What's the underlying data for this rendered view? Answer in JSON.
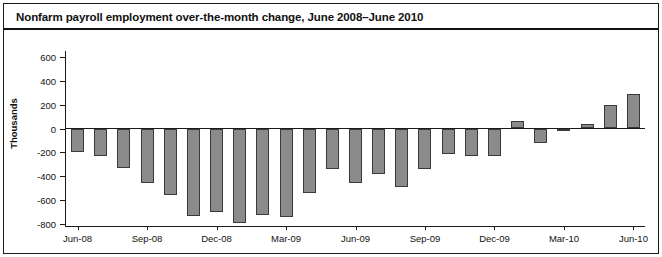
{
  "figure": {
    "title": "Nonfarm payroll employment over-the-month change, June 2008–June 2010"
  },
  "axes": {
    "ylabel": "Thousands",
    "yticks": [
      "600",
      "400",
      "200",
      "0",
      "-200",
      "-400",
      "-600",
      "-800"
    ],
    "xticks": [
      "Jun-08",
      "Sep-08",
      "Dec-08",
      "Mar-09",
      "Jun-09",
      "Sep-09",
      "Dec-09",
      "Mar-10",
      "Jun-10"
    ]
  },
  "colors": {
    "bar_fill": "#8b8b8b",
    "bar_edge": "#3a3a3a",
    "axis": "#1a1a1a",
    "text": "#111111"
  },
  "chart_data": {
    "type": "bar",
    "title": "Nonfarm payroll employment over-the-month change, June 2008–June 2010",
    "xlabel": "",
    "ylabel": "Thousands",
    "ylim": [
      -800,
      600
    ],
    "ytick_values": [
      600,
      400,
      200,
      0,
      -200,
      -400,
      -600,
      -800
    ],
    "grid": false,
    "legend": null,
    "categories": [
      "Jun-08",
      "Jul-08",
      "Aug-08",
      "Sep-08",
      "Oct-08",
      "Nov-08",
      "Dec-08",
      "Jan-09",
      "Feb-09",
      "Mar-09",
      "Apr-09",
      "May-09",
      "Jun-09",
      "Jul-09",
      "Aug-09",
      "Sep-09",
      "Oct-09",
      "Nov-09",
      "Dec-09",
      "Jan-10",
      "Feb-10",
      "Mar-10",
      "Apr-10",
      "May-10",
      "Jun-10"
    ],
    "labeled_categories": [
      "Jun-08",
      "Sep-08",
      "Dec-08",
      "Mar-09",
      "Jun-09",
      "Sep-09",
      "Dec-09",
      "Mar-10",
      "Jun-10"
    ],
    "values": [
      -200,
      -230,
      -330,
      -460,
      -560,
      -730,
      -700,
      -790,
      -720,
      -740,
      -540,
      -340,
      -460,
      -380,
      -490,
      -340,
      -210,
      -230,
      -230,
      60,
      -120,
      -10,
      40,
      200,
      290
    ],
    "values_note": "Monthly over-the-month change in thousands of jobs"
  },
  "series_plot": {
    "bars": [
      {
        "label": "Jun-08",
        "value": -200
      },
      {
        "label": "Jul-08",
        "value": -230
      },
      {
        "label": "Aug-08",
        "value": -330
      },
      {
        "label": "Sep-08",
        "value": -460
      },
      {
        "label": "Oct-08",
        "value": -560
      },
      {
        "label": "Nov-08",
        "value": -730
      },
      {
        "label": "Dec-08",
        "value": -700
      },
      {
        "label": "Jan-09",
        "value": -790
      },
      {
        "label": "Feb-09",
        "value": -720
      },
      {
        "label": "Mar-09",
        "value": -740
      },
      {
        "label": "Apr-09",
        "value": -540
      },
      {
        "label": "May-09",
        "value": -340
      },
      {
        "label": "Jun-09",
        "value": -460
      },
      {
        "label": "Jul-09",
        "value": -380
      },
      {
        "label": "Aug-09",
        "value": -490
      },
      {
        "label": "Sep-09",
        "value": -340
      },
      {
        "label": "Oct-09",
        "value": -210
      },
      {
        "label": "Nov-09",
        "value": -230
      },
      {
        "label": "Dec-09",
        "value": -230
      },
      {
        "label": "Jan-10",
        "value": 60
      },
      {
        "label": "Feb-10",
        "value": -120
      },
      {
        "label": "Mar-10",
        "value": -10
      },
      {
        "label": "Apr-10",
        "value": 40
      },
      {
        "label": "May-10",
        "value": 200
      },
      {
        "label": "Jun-10",
        "value": 290
      }
    ]
  }
}
